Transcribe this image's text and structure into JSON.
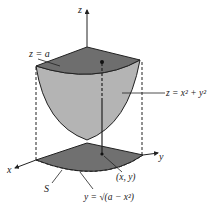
{
  "figure": {
    "axes": {
      "x_label": "x",
      "y_label": "y",
      "z_label": "z"
    },
    "labels": {
      "top_plane": "z = a",
      "surface": "z = x² + y²",
      "region": "S",
      "point": "(x, y)",
      "boundary": "y = √(a − x²)"
    },
    "colors": {
      "cap_fill": "#6e6e6e",
      "surface_fill": "#b4b4b4",
      "region_fill": "#707070",
      "line": "#222222",
      "background": "#ffffff"
    }
  }
}
